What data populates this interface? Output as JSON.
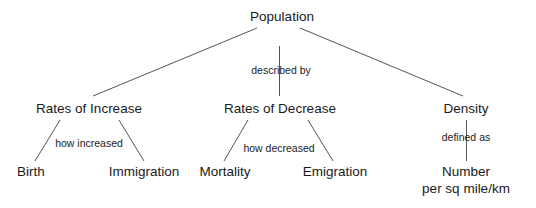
{
  "diagram": {
    "type": "concept-map",
    "root": {
      "label": "Population"
    },
    "root_link": {
      "label": "described by"
    },
    "branches": [
      {
        "label": "Rates of Increase",
        "link": "how increased",
        "children": [
          "Birth",
          "Immigration"
        ]
      },
      {
        "label": "Rates of Decrease",
        "link": "how decreased",
        "children": [
          "Mortality",
          "Emigration"
        ]
      },
      {
        "label": "Density",
        "link": "defined as",
        "children": [
          "Number",
          "per sq mile/km"
        ]
      }
    ],
    "colors": {
      "line": "#555555",
      "text": "#1a1a1a",
      "background": "#ffffff"
    }
  }
}
